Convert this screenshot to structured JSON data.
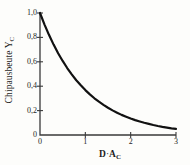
{
  "chart_data": {
    "type": "line",
    "title": "",
    "xlabel": "D · A_C",
    "ylabel": "Chipausbeute Y_C",
    "ylabel_main": "Chipausbeute Y",
    "ylabel_sub": "C",
    "xlabel_main": "D",
    "xlabel_operator": "·",
    "xlabel_second": "A",
    "xlabel_sub": "C",
    "xlim": [
      0,
      3
    ],
    "ylim": [
      0,
      1.0
    ],
    "grid": false,
    "legend": null,
    "decimal_separator": ",",
    "y_ticks": [
      0,
      0.2,
      0.4,
      0.6,
      0.8,
      1.0
    ],
    "y_tick_labels": [
      "0",
      "0,2",
      "0,4",
      "0,6",
      "0,8",
      "1,0"
    ],
    "x_ticks": [
      0,
      1,
      2,
      3
    ],
    "x_tick_labels": [
      "0",
      "1",
      "2",
      "3"
    ],
    "series": [
      {
        "name": "Chipausbeute",
        "formula": "Y_C = exp(-D*A_C)",
        "color": "#111111",
        "linewidth": 2.2,
        "x": [
          0,
          0.1,
          0.2,
          0.3,
          0.4,
          0.5,
          0.6,
          0.7,
          0.8,
          0.9,
          1.0,
          1.1,
          1.2,
          1.3,
          1.4,
          1.5,
          1.6,
          1.7,
          1.8,
          1.9,
          2.0,
          2.1,
          2.2,
          2.3,
          2.4,
          2.5,
          2.6,
          2.7,
          2.8,
          2.9,
          3.0
        ],
        "values": [
          1.0,
          0.905,
          0.819,
          0.741,
          0.67,
          0.607,
          0.549,
          0.497,
          0.449,
          0.407,
          0.368,
          0.333,
          0.301,
          0.273,
          0.247,
          0.223,
          0.202,
          0.183,
          0.165,
          0.15,
          0.135,
          0.122,
          0.111,
          0.1,
          0.091,
          0.082,
          0.074,
          0.067,
          0.061,
          0.055,
          0.05
        ]
      }
    ],
    "axis_color": "#3a3a3a",
    "background": "#fdfdfb"
  }
}
